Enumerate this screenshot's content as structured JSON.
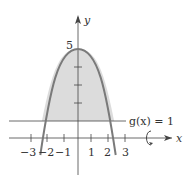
{
  "figure": {
    "function": "f(x) = 5 - x^2",
    "line_label": "g(x) = 1",
    "x_axis_label": "x",
    "y_axis_label": "y",
    "y_peak_label": "5",
    "x_ticks": [
      "−3",
      "−2",
      "−1",
      "1",
      "2",
      "3"
    ],
    "rotation_icon": "rotation-arrow-icon",
    "colors": {
      "curve": "#777777",
      "fill": "#d9d9d9",
      "axes": "#333333"
    }
  }
}
